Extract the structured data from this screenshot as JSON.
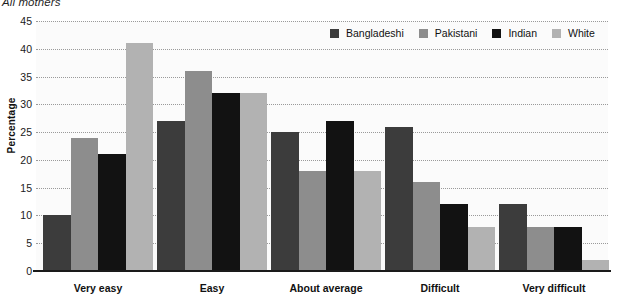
{
  "title": "All mothers",
  "axis": {
    "ylabel": "Percentage",
    "yticks": [
      "0",
      "5",
      "10",
      "15",
      "20",
      "25",
      "30",
      "35",
      "40",
      "45"
    ]
  },
  "legend": {
    "items": [
      {
        "label": "Bangladeshi",
        "color": "#3c3c3c"
      },
      {
        "label": "Pakistani",
        "color": "#8d8d8d"
      },
      {
        "label": "Indian",
        "color": "#121212"
      },
      {
        "label": "White",
        "color": "#b2b2b2"
      }
    ]
  },
  "chart_data": {
    "type": "bar",
    "title": "All mothers",
    "xlabel": "",
    "ylabel": "Percentage",
    "ylim": [
      0,
      45
    ],
    "ytick_step": 5,
    "grid": true,
    "legend_position": "top-right",
    "categories": [
      "Very easy",
      "Easy",
      "About average",
      "Difficult",
      "Very difficult"
    ],
    "series": [
      {
        "name": "Bangladeshi",
        "color": "#3c3c3c",
        "values": [
          10,
          27,
          25,
          26,
          12
        ]
      },
      {
        "name": "Pakistani",
        "color": "#8d8d8d",
        "values": [
          24,
          36,
          18,
          16,
          8
        ]
      },
      {
        "name": "Indian",
        "color": "#121212",
        "values": [
          21,
          32,
          27,
          12,
          8
        ]
      },
      {
        "name": "White",
        "color": "#b2b2b2",
        "values": [
          41,
          32,
          18,
          8,
          2
        ]
      }
    ]
  }
}
